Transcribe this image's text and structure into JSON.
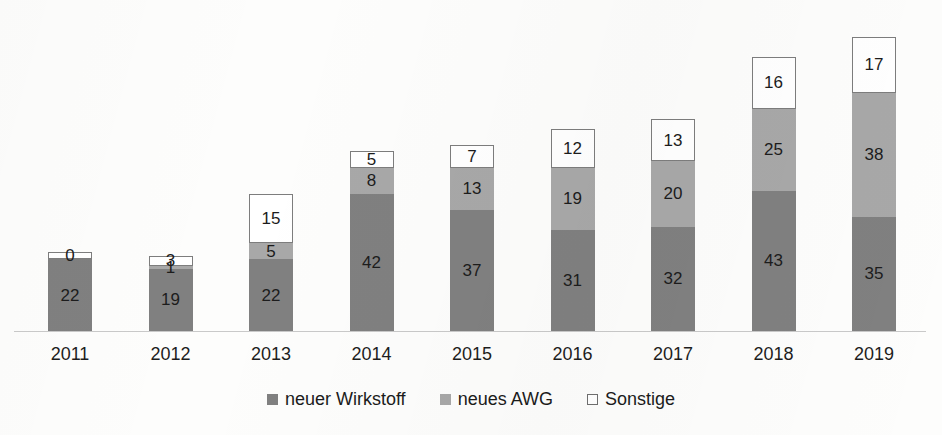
{
  "chart_data": {
    "type": "bar",
    "subtype": "stacked-bar",
    "title": "",
    "subtitle": "",
    "xlabel": "",
    "ylabel": "",
    "grid": false,
    "axis_visible": {
      "x_baseline": true,
      "y_axis": false
    },
    "ylim": [
      0,
      90
    ],
    "categories": [
      "2011",
      "2012",
      "2013",
      "2014",
      "2015",
      "2016",
      "2017",
      "2018",
      "2019"
    ],
    "legend_position": "bottom-center",
    "series": [
      {
        "name": "neuer Wirkstoff",
        "color": "#808080",
        "values": [
          22,
          19,
          22,
          42,
          37,
          31,
          32,
          43,
          35
        ]
      },
      {
        "name": "neues AWG",
        "color": "#a8a8a8",
        "values": [
          0,
          1,
          5,
          8,
          13,
          19,
          20,
          25,
          38
        ]
      },
      {
        "name": "Sonstige",
        "color": "#ffffff",
        "values": [
          0,
          3,
          15,
          5,
          7,
          12,
          13,
          16,
          17
        ]
      }
    ],
    "totals": [
      22,
      23,
      42,
      55,
      57,
      62,
      65,
      84,
      90
    ]
  },
  "legend": {
    "items": [
      {
        "label": "neuer Wirkstoff",
        "swatch": "filled-dark-gray-square"
      },
      {
        "label": "neues AWG",
        "swatch": "filled-medium-gray-square"
      },
      {
        "label": "Sonstige",
        "swatch": "outlined-white-square"
      }
    ]
  },
  "axis": {
    "x_tick_labels": [
      "2011",
      "2012",
      "2013",
      "2014",
      "2015",
      "2016",
      "2017",
      "2018",
      "2019"
    ]
  },
  "colors": {
    "wirkstoff": "#808080",
    "awg": "#a8a8a8",
    "sonstige": "#ffffff",
    "sonstige_border": "#7d7d7d",
    "baseline": "#c9c9c9",
    "text": "#1c1c1c",
    "background": "#fdfdfc"
  }
}
